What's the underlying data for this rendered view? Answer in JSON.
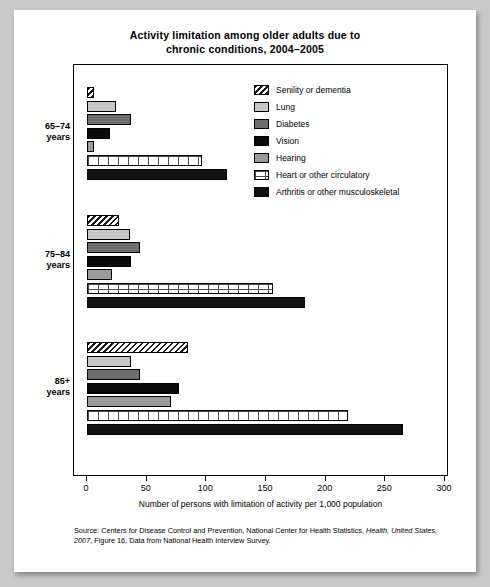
{
  "figure": {
    "title_line1": "Activity limitation among older adults due to",
    "title_line2": "chronic conditions, 2004–2005",
    "source_line1_a": "Source: Centers for Disease Control and Prevention, National Center for Health Statistics, ",
    "source_line1_b": "Health,",
    "source_line2_a": "United States, 2007",
    "source_line2_b": ", Figure 16, Data from National Health Interview Survey."
  },
  "chart_data": {
    "type": "bar",
    "orientation": "horizontal",
    "title": "Activity limitation among older adults due to chronic conditions, 2004–2005",
    "xlabel": "Number of persons with limitation of activity per 1,000 population",
    "ylabel": "",
    "xlim": [
      0,
      300
    ],
    "xticks": [
      0,
      50,
      100,
      150,
      200,
      250,
      300
    ],
    "xticklabels": [
      "0",
      "50",
      "100",
      "150",
      "200",
      "250",
      "300"
    ],
    "grid": false,
    "legend_position": "upper right",
    "categories": [
      "65–74 years",
      "75–84 years",
      "85+ years"
    ],
    "category_labels": [
      {
        "line1": "65–74",
        "line2": "years"
      },
      {
        "line1": "75–84",
        "line2": "years"
      },
      {
        "line1": "85+",
        "line2": "years"
      }
    ],
    "series": [
      {
        "name": "Senility or dementia",
        "pattern": "diagonal-hatch",
        "color": "#ffffff",
        "values": [
          6,
          27,
          85
        ]
      },
      {
        "name": "Lung",
        "pattern": "solid",
        "color": "#c8c8c8",
        "values": [
          24,
          36,
          37
        ]
      },
      {
        "name": "Diabetes",
        "pattern": "solid",
        "color": "#6e6e6e",
        "values": [
          37,
          44,
          44
        ]
      },
      {
        "name": "Vision",
        "pattern": "solid",
        "color": "#0a0a0a",
        "values": [
          19,
          37,
          77
        ]
      },
      {
        "name": "Hearing",
        "pattern": "solid",
        "color": "#9a9a9a",
        "values": [
          6,
          21,
          70
        ]
      },
      {
        "name": "Heart or other circulatory",
        "pattern": "grid-hatch",
        "color": "#ffffff",
        "values": [
          96,
          156,
          219
        ]
      },
      {
        "name": "Arthritis or other musculoskeletal",
        "pattern": "solid",
        "color": "#111111",
        "values": [
          117,
          183,
          265
        ]
      }
    ]
  }
}
